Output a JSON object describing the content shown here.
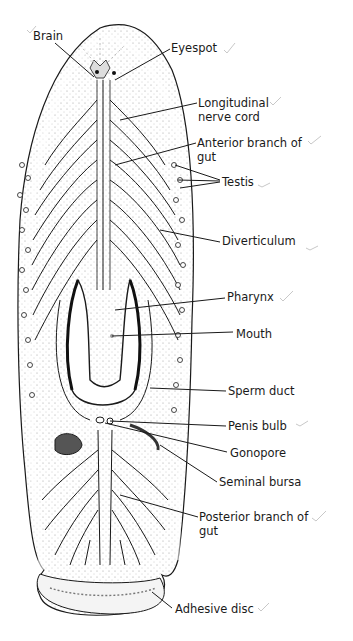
{
  "diagram": {
    "labels": [
      {
        "id": "brain",
        "text": "Brain",
        "x": 33,
        "y": 29
      },
      {
        "id": "eyespot",
        "text": "Eyespot",
        "x": 171,
        "y": 41
      },
      {
        "id": "longitudinal-nerve-cord",
        "text": "Longitudinal\nnerve cord",
        "x": 198,
        "y": 96
      },
      {
        "id": "anterior-branch-of-gut",
        "text": "Anterior branch of\ngut",
        "x": 197,
        "y": 136
      },
      {
        "id": "testis",
        "text": "Testis",
        "x": 222,
        "y": 175
      },
      {
        "id": "diverticulum",
        "text": "Diverticulum",
        "x": 222,
        "y": 234
      },
      {
        "id": "pharynx",
        "text": "Pharynx",
        "x": 227,
        "y": 290
      },
      {
        "id": "mouth",
        "text": "Mouth",
        "x": 236,
        "y": 327
      },
      {
        "id": "sperm-duct",
        "text": "Sperm duct",
        "x": 228,
        "y": 384
      },
      {
        "id": "penis-bulb",
        "text": "Penis bulb",
        "x": 228,
        "y": 419
      },
      {
        "id": "gonopore",
        "text": "Gonopore",
        "x": 230,
        "y": 446
      },
      {
        "id": "seminal-bursa",
        "text": "Seminal bursa",
        "x": 219,
        "y": 475
      },
      {
        "id": "posterior-branch-of-gut",
        "text": "Posterior branch of\ngut",
        "x": 199,
        "y": 510
      },
      {
        "id": "adhesive-disc",
        "text": "Adhesive disc",
        "x": 175,
        "y": 602
      }
    ],
    "colors": {
      "line": "#1a1a1a",
      "tick": "#c8c8c8",
      "stipple": "#8a8a8a",
      "background": "#ffffff"
    }
  }
}
